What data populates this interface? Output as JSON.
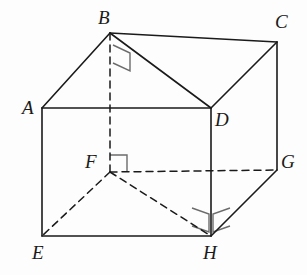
{
  "figure": {
    "background_color": "#fdfdfd",
    "stroke_color": "#1a1a1a",
    "marker_color": "#6b6b6b",
    "solid_stroke_width": 1.6,
    "dashed_stroke_width": 1.5,
    "dash_pattern": "7,5"
  },
  "vertices": [
    {
      "id": "A",
      "label": "A",
      "x": 42,
      "y": 108,
      "label_x": 22,
      "label_y": 98,
      "hidden": false
    },
    {
      "id": "B",
      "label": "B",
      "x": 110,
      "y": 33,
      "label_x": 98,
      "label_y": 8,
      "hidden": false
    },
    {
      "id": "C",
      "label": "C",
      "x": 277,
      "y": 42,
      "label_x": 275,
      "label_y": 12,
      "hidden": false
    },
    {
      "id": "D",
      "label": "D",
      "x": 211,
      "y": 108,
      "label_x": 215,
      "label_y": 110,
      "hidden": false
    },
    {
      "id": "E",
      "label": "E",
      "x": 42,
      "y": 236,
      "label_x": 32,
      "label_y": 243,
      "hidden": false
    },
    {
      "id": "F",
      "label": "F",
      "x": 110,
      "y": 172,
      "label_x": 85,
      "label_y": 152,
      "hidden": true
    },
    {
      "id": "G",
      "label": "G",
      "x": 277,
      "y": 170,
      "label_x": 281,
      "label_y": 152,
      "hidden": false
    },
    {
      "id": "H",
      "label": "H",
      "x": 211,
      "y": 236,
      "label_x": 203,
      "label_y": 243,
      "hidden": false
    }
  ],
  "edges_solid": [
    {
      "name": "edge-A-B",
      "from": "A",
      "to": "B"
    },
    {
      "name": "edge-B-C",
      "from": "B",
      "to": "C"
    },
    {
      "name": "edge-A-D",
      "from": "A",
      "to": "D"
    },
    {
      "name": "edge-D-C",
      "from": "D",
      "to": "C"
    },
    {
      "name": "edge-B-D",
      "from": "B",
      "to": "D"
    },
    {
      "name": "edge-A-E",
      "from": "A",
      "to": "E"
    },
    {
      "name": "edge-D-H",
      "from": "D",
      "to": "H"
    },
    {
      "name": "edge-C-G",
      "from": "C",
      "to": "G"
    },
    {
      "name": "edge-E-H",
      "from": "E",
      "to": "H"
    },
    {
      "name": "edge-H-G",
      "from": "H",
      "to": "G"
    }
  ],
  "edges_dashed": [
    {
      "name": "edge-B-F",
      "from": "B",
      "to": "F"
    },
    {
      "name": "edge-F-E",
      "from": "F",
      "to": "E"
    },
    {
      "name": "edge-F-H",
      "from": "F",
      "to": "H"
    },
    {
      "name": "edge-F-G",
      "from": "F",
      "to": "G"
    }
  ],
  "right_angle_markers": [
    {
      "name": "right-angle-marker-B",
      "at_vertex": "B",
      "type": "single-skewed-square",
      "points": "113,45 130,53 130,71 113,63"
    },
    {
      "name": "right-angle-marker-F",
      "at_vertex": "F",
      "type": "single-square",
      "points": "110,155 127,155 127,172"
    },
    {
      "name": "right-angle-marker-H-left",
      "at_vertex": "H",
      "type": "double-square-left",
      "points": "192,208 209,214 209,232 192,226"
    },
    {
      "name": "right-angle-marker-H-right",
      "at_vertex": "H",
      "type": "double-square-right",
      "points": "230,208 213,214 213,232 230,226"
    }
  ]
}
